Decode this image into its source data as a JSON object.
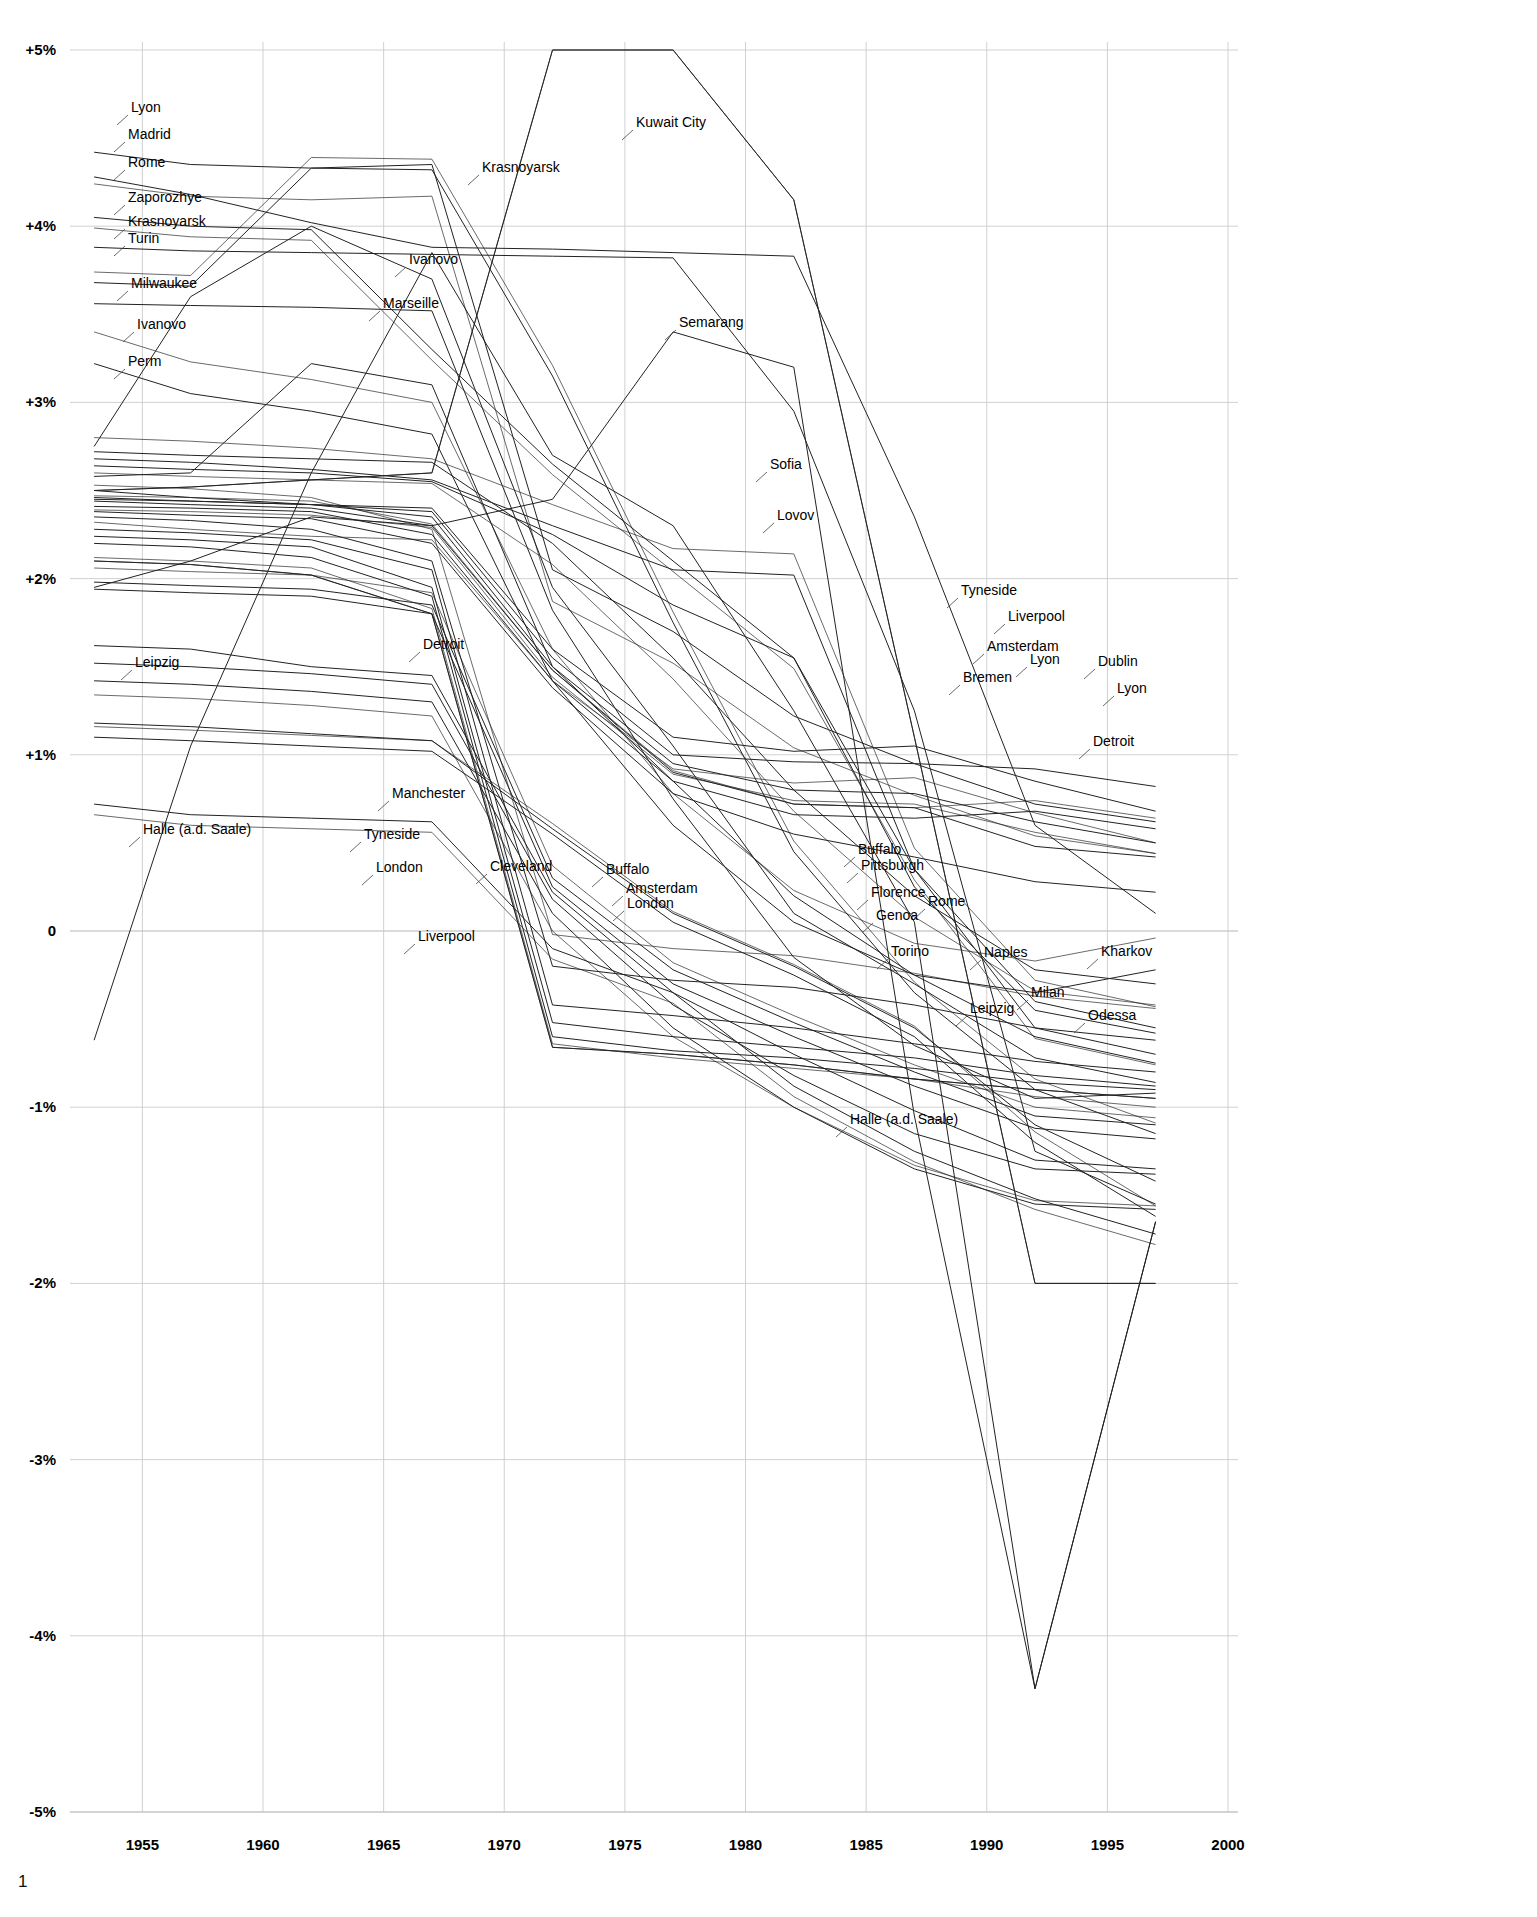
{
  "page": {
    "number": "1",
    "background": "#ffffff",
    "line_color": "#222222",
    "grid_color": "#cccccc",
    "axis_color": "#bbbbbb"
  },
  "chart_data": {
    "type": "line",
    "title": "",
    "subtitle": "",
    "xlabel": "",
    "ylabel": "",
    "xlim": [
      1952,
      2000
    ],
    "ylim": [
      -5,
      5
    ],
    "grid": true,
    "legend_position": "inline-callouts",
    "x_ticks": [
      "1955",
      "1960",
      "1965",
      "1970",
      "1975",
      "1980",
      "1985",
      "1990",
      "1995",
      "2000"
    ],
    "x_tick_values": [
      1955,
      1960,
      1965,
      1970,
      1975,
      1980,
      1985,
      1990,
      1995,
      2000
    ],
    "y_ticks": [
      "+5%",
      "+4%",
      "+3%",
      "+2%",
      "+1%",
      "0",
      "-1%",
      "-2%",
      "-3%",
      "-4%",
      "-5%"
    ],
    "y_tick_values": [
      5,
      4,
      3,
      2,
      1,
      0,
      -1,
      -2,
      -3,
      -4,
      -5
    ],
    "x": [
      1953,
      1957,
      1962,
      1967,
      1972,
      1977,
      1982,
      1987,
      1992,
      1997
    ],
    "series": [
      {
        "name": "Lyon",
        "values": [
          4.42,
          4.35,
          4.33,
          4.35,
          2.05,
          1.7,
          1.22,
          0.95,
          0.72,
          0.62
        ]
      },
      {
        "name": "Madrid",
        "values": [
          4.28,
          4.18,
          4.02,
          3.88,
          3.87,
          3.85,
          3.83,
          2.35,
          0.6,
          0.1
        ]
      },
      {
        "name": "Rome",
        "values": [
          4.05,
          4.0,
          3.98,
          3.3,
          2.65,
          2.1,
          1.55,
          0.35,
          -0.55,
          -0.7
        ]
      },
      {
        "name": "Zaporozhye",
        "values": [
          3.88,
          3.86,
          3.85,
          3.84,
          3.83,
          3.82,
          2.95,
          1.25,
          -1.25,
          -1.55
        ]
      },
      {
        "name": "Krasnoyarsk",
        "values": [
          3.68,
          3.66,
          4.33,
          4.32,
          3.15,
          1.75,
          0.45,
          -0.35,
          -0.9,
          -1.15
        ]
      },
      {
        "name": "Turin",
        "values": [
          3.56,
          3.55,
          3.54,
          3.52,
          1.82,
          0.75,
          -0.15,
          -0.65,
          -0.95,
          -0.92
        ]
      },
      {
        "name": "Milwaukee",
        "values": [
          3.22,
          3.05,
          2.95,
          2.82,
          1.42,
          0.6,
          0.05,
          -0.25,
          -0.35,
          -0.22
        ]
      },
      {
        "name": "Ivanovo",
        "values": [
          2.75,
          3.6,
          4.0,
          3.7,
          1.95,
          1.05,
          0.1,
          -0.3,
          -0.72,
          -0.86
        ]
      },
      {
        "name": "Perm",
        "values": [
          2.72,
          2.7,
          2.68,
          2.66,
          2.2,
          1.55,
          0.8,
          0.2,
          -0.22,
          -0.3
        ]
      },
      {
        "name": "Marseille",
        "values": [
          2.58,
          2.6,
          3.22,
          3.1,
          1.5,
          0.85,
          0.2,
          -0.25,
          -0.6,
          -0.75
        ]
      },
      {
        "name": "Kuwait City",
        "values": [
          2.5,
          2.52,
          2.56,
          2.6,
          5.0,
          5.0,
          4.15,
          1.1,
          -2.0,
          -2.0
        ]
      },
      {
        "name": "Semarang",
        "values": [
          1.95,
          2.1,
          2.35,
          2.3,
          2.45,
          3.4,
          3.2,
          -1.05,
          -4.3,
          -1.65
        ]
      },
      {
        "name": "Sofia",
        "values": [
          2.68,
          2.66,
          2.62,
          2.56,
          2.3,
          2.05,
          2.02,
          0.35,
          -0.4,
          -0.55
        ]
      },
      {
        "name": "Lovov",
        "values": [
          2.64,
          2.62,
          2.6,
          2.55,
          2.25,
          1.85,
          1.55,
          0.25,
          -0.45,
          -0.58
        ]
      },
      {
        "name": "Tyneside",
        "values": [
          2.5,
          2.46,
          2.42,
          2.4,
          1.6,
          1.1,
          1.02,
          1.05,
          0.85,
          0.68
        ]
      },
      {
        "name": "Liverpool",
        "values": [
          2.46,
          2.44,
          2.42,
          2.38,
          1.55,
          1.0,
          0.96,
          0.95,
          0.92,
          0.82
        ]
      },
      {
        "name": "Amsterdam",
        "values": [
          2.45,
          2.44,
          2.42,
          2.35,
          1.5,
          0.95,
          0.8,
          0.78,
          0.62,
          0.5
        ]
      },
      {
        "name": "Bremen",
        "values": [
          2.44,
          2.42,
          2.4,
          2.3,
          1.48,
          0.9,
          0.72,
          0.7,
          0.48,
          0.42
        ]
      },
      {
        "name": "Dublin",
        "values": [
          2.41,
          2.4,
          2.38,
          2.25,
          1.42,
          0.85,
          0.66,
          0.64,
          0.68,
          0.58
        ]
      },
      {
        "name": "Detroit",
        "values": [
          2.38,
          2.36,
          2.34,
          2.2,
          1.38,
          0.78,
          0.55,
          0.42,
          0.28,
          0.22
        ]
      },
      {
        "name": "Manchester",
        "values": [
          2.35,
          2.33,
          2.28,
          2.1,
          -0.2,
          -0.28,
          -0.32,
          -0.42,
          -0.55,
          -0.62
        ]
      },
      {
        "name": "London",
        "values": [
          2.28,
          2.26,
          2.22,
          2.05,
          -0.42,
          -0.48,
          -0.55,
          -0.64,
          -0.74,
          -0.8
        ]
      },
      {
        "name": "Cleveland",
        "values": [
          2.24,
          2.22,
          2.18,
          1.95,
          -0.52,
          -0.6,
          -0.66,
          -0.72,
          -0.82,
          -0.88
        ]
      },
      {
        "name": "Buffalo",
        "values": [
          2.2,
          2.18,
          2.12,
          1.9,
          -0.6,
          -0.68,
          -0.72,
          -0.78,
          -0.86,
          -0.9
        ]
      },
      {
        "name": "Pittsburgh",
        "values": [
          2.1,
          2.08,
          2.02,
          1.8,
          -0.66,
          -0.7,
          -0.76,
          -0.84,
          -0.9,
          -0.95
        ]
      },
      {
        "name": "Florence",
        "values": [
          1.98,
          1.96,
          1.94,
          1.85,
          0.3,
          -0.22,
          -0.52,
          -0.8,
          -1.05,
          -1.1
        ]
      },
      {
        "name": "Genoa",
        "values": [
          1.94,
          1.92,
          1.9,
          1.8,
          0.25,
          -0.3,
          -0.6,
          -0.88,
          -1.12,
          -1.18
        ]
      },
      {
        "name": "Torino",
        "values": [
          1.62,
          1.6,
          1.5,
          1.45,
          0.22,
          -0.35,
          -0.7,
          -1.02,
          -1.3,
          -1.35
        ]
      },
      {
        "name": "Naples",
        "values": [
          1.52,
          1.5,
          1.46,
          1.4,
          0.18,
          -0.42,
          -0.82,
          -1.15,
          -1.35,
          -1.38
        ]
      },
      {
        "name": "Milan",
        "values": [
          1.42,
          1.4,
          1.36,
          1.3,
          0.1,
          -0.55,
          -1.0,
          -1.35,
          -1.55,
          -1.58
        ]
      },
      {
        "name": "Leipzig",
        "values": [
          0.72,
          0.66,
          0.64,
          0.62,
          -0.1,
          -0.35,
          -0.88,
          -1.25,
          -1.52,
          -1.72
        ]
      },
      {
        "name": "Halle (a.d. Saale)",
        "values": [
          -0.62,
          1.05,
          2.6,
          3.85,
          2.7,
          2.3,
          1.25,
          0.05,
          -4.3,
          -1.65
        ]
      },
      {
        "name": "Odessa",
        "values": [
          1.1,
          1.08,
          1.05,
          1.02,
          0.55,
          0.05,
          -0.25,
          -0.6,
          -1.2,
          -1.62
        ]
      },
      {
        "name": "Kharkov",
        "values": [
          1.18,
          1.16,
          1.12,
          1.08,
          0.58,
          0.1,
          -0.2,
          -0.55,
          -1.1,
          -1.42
        ]
      }
    ],
    "callouts": [
      {
        "label": "Lyon",
        "x": 131,
        "y": 112
      },
      {
        "label": "Madrid",
        "x": 128,
        "y": 139
      },
      {
        "label": "Rome",
        "x": 128,
        "y": 167
      },
      {
        "label": "Zaporozhye",
        "x": 128,
        "y": 202
      },
      {
        "label": "Krasnoyarsk",
        "x": 128,
        "y": 226
      },
      {
        "label": "Turin",
        "x": 128,
        "y": 243
      },
      {
        "label": "Milwaukee",
        "x": 131,
        "y": 288
      },
      {
        "label": "Ivanovo",
        "x": 137,
        "y": 329
      },
      {
        "label": "Perm",
        "x": 128,
        "y": 366
      },
      {
        "label": "Krasnoyarsk",
        "x": 482,
        "y": 172
      },
      {
        "label": "Ivanovo",
        "x": 409,
        "y": 264
      },
      {
        "label": "Marseille",
        "x": 383,
        "y": 308
      },
      {
        "label": "Kuwait City",
        "x": 636,
        "y": 127
      },
      {
        "label": "Semarang",
        "x": 679,
        "y": 327
      },
      {
        "label": "Sofia",
        "x": 770,
        "y": 469
      },
      {
        "label": "Lovov",
        "x": 777,
        "y": 520
      },
      {
        "label": "Tyneside",
        "x": 961,
        "y": 595
      },
      {
        "label": "Liverpool",
        "x": 1008,
        "y": 621
      },
      {
        "label": "Amsterdam",
        "x": 987,
        "y": 651
      },
      {
        "label": "Lyon",
        "x": 1030,
        "y": 664
      },
      {
        "label": "Dublin",
        "x": 1098,
        "y": 666
      },
      {
        "label": "Bremen",
        "x": 963,
        "y": 682
      },
      {
        "label": "Lyon",
        "x": 1117,
        "y": 693
      },
      {
        "label": "Detroit",
        "x": 1093,
        "y": 746
      },
      {
        "label": "Leipzig",
        "x": 135,
        "y": 667
      },
      {
        "label": "Detroit",
        "x": 423,
        "y": 649
      },
      {
        "label": "Manchester",
        "x": 392,
        "y": 798
      },
      {
        "label": "Halle (a.d. Saale)",
        "x": 143,
        "y": 834
      },
      {
        "label": "Tyneside",
        "x": 364,
        "y": 839
      },
      {
        "label": "London",
        "x": 376,
        "y": 872
      },
      {
        "label": "Cleveland",
        "x": 490,
        "y": 871
      },
      {
        "label": "Buffalo",
        "x": 606,
        "y": 874
      },
      {
        "label": "Amsterdam",
        "x": 626,
        "y": 893
      },
      {
        "label": "London",
        "x": 627,
        "y": 908
      },
      {
        "label": "Buffalo",
        "x": 858,
        "y": 854
      },
      {
        "label": "Pittsburgh",
        "x": 861,
        "y": 870
      },
      {
        "label": "Florence",
        "x": 871,
        "y": 897
      },
      {
        "label": "Rome",
        "x": 928,
        "y": 906
      },
      {
        "label": "Genoa",
        "x": 876,
        "y": 920
      },
      {
        "label": "Liverpool",
        "x": 418,
        "y": 941
      },
      {
        "label": "Torino",
        "x": 891,
        "y": 956
      },
      {
        "label": "Naples",
        "x": 984,
        "y": 957
      },
      {
        "label": "Kharkov",
        "x": 1101,
        "y": 956
      },
      {
        "label": "Milan",
        "x": 1031,
        "y": 997
      },
      {
        "label": "Leipzig",
        "x": 970,
        "y": 1013
      },
      {
        "label": "Odessa",
        "x": 1088,
        "y": 1020
      },
      {
        "label": "Halle (a.d. Saale)",
        "x": 850,
        "y": 1124
      }
    ]
  }
}
